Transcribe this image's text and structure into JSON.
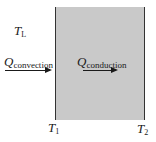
{
  "diagram": {
    "title": "",
    "labels": {
      "fluid_temp": {
        "symbol": "T",
        "subscript": "L"
      },
      "convection": {
        "symbol": "Q",
        "subscript": "convection"
      },
      "conduction": {
        "symbol": "Q",
        "subscript": "conduction"
      },
      "surface_left": {
        "symbol": "T",
        "subscript": "1"
      },
      "surface_right": {
        "symbol": "T",
        "subscript": "2"
      }
    },
    "colors": {
      "slab_fill": "#c9c9c9",
      "slab_border": "#333333",
      "text": "#1a1a1a"
    }
  }
}
